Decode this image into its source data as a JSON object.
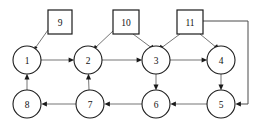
{
  "diagram": {
    "canvas": {
      "width": 259,
      "height": 124,
      "background": "#ffffff"
    },
    "colors": {
      "node_stroke": "#1c1c1c",
      "node_fill": "#ffffff",
      "edge": "#6e6e6e",
      "edge_dark": "#4a4a4a",
      "arrow": "#1a1a1a",
      "label": "#111111"
    },
    "circle_nodes": [
      {
        "id": "1",
        "label": "1",
        "cx": 27,
        "cy": 60,
        "r": 14
      },
      {
        "id": "2",
        "label": "2",
        "cx": 88,
        "cy": 60,
        "r": 14
      },
      {
        "id": "3",
        "label": "3",
        "cx": 156,
        "cy": 60,
        "r": 14
      },
      {
        "id": "4",
        "label": "4",
        "cx": 221,
        "cy": 60,
        "r": 14
      },
      {
        "id": "5",
        "label": "5",
        "cx": 221,
        "cy": 104,
        "r": 14
      },
      {
        "id": "6",
        "label": "6",
        "cx": 156,
        "cy": 104,
        "r": 14
      },
      {
        "id": "7",
        "label": "7",
        "cx": 90,
        "cy": 104,
        "r": 14
      },
      {
        "id": "8",
        "label": "8",
        "cx": 27,
        "cy": 104,
        "r": 14
      }
    ],
    "square_nodes": [
      {
        "id": "9",
        "label": "9",
        "x": 48,
        "y": 10,
        "w": 24,
        "h": 24
      },
      {
        "id": "10",
        "label": "10",
        "x": 113,
        "y": 10,
        "w": 26,
        "h": 24
      },
      {
        "id": "11",
        "label": "11",
        "x": 177,
        "y": 10,
        "w": 26,
        "h": 24
      }
    ],
    "edges": [
      {
        "from": "9",
        "to": "1",
        "kind": "diagonal"
      },
      {
        "from": "10",
        "to": "2",
        "kind": "diagonal"
      },
      {
        "from": "10",
        "to": "3",
        "kind": "diagonal"
      },
      {
        "from": "11",
        "to": "3",
        "kind": "diagonal"
      },
      {
        "from": "11",
        "to": "4",
        "kind": "diagonal"
      },
      {
        "from": "1",
        "to": "2",
        "kind": "horizontal"
      },
      {
        "from": "2",
        "to": "3",
        "kind": "horizontal"
      },
      {
        "from": "3",
        "to": "4",
        "kind": "horizontal"
      },
      {
        "from": "8",
        "to": "1",
        "kind": "vertical-up"
      },
      {
        "from": "7",
        "to": "2",
        "kind": "vertical-up"
      },
      {
        "from": "3",
        "to": "6",
        "kind": "vertical-down"
      },
      {
        "from": "4",
        "to": "5",
        "kind": "vertical-down"
      },
      {
        "from": "5",
        "to": "6",
        "kind": "horizontal"
      },
      {
        "from": "6",
        "to": "7",
        "kind": "horizontal"
      },
      {
        "from": "7",
        "to": "8",
        "kind": "horizontal"
      },
      {
        "from": "11",
        "to": "5",
        "kind": "routed-right-down"
      }
    ]
  }
}
